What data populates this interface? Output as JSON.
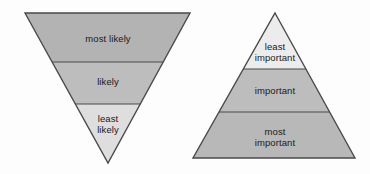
{
  "canvas": {
    "width": 370,
    "height": 174,
    "background": "#fdfdfd"
  },
  "colors": {
    "band_dark": "#b3b3b3",
    "band_mid": "#bdbdbd",
    "band_light": "#dedede",
    "band_lightest": "#ececec",
    "outline": "#4a4a4a",
    "divider": "#4a4a4a",
    "text": "#1a1a1a"
  },
  "diagrams": [
    {
      "id": "likelihood-triangle",
      "name": "inverted-triangle-likelihood",
      "orientation": "inverted",
      "geometry": {
        "top_left_x": 25,
        "top_right_x": 190,
        "top_y": 13,
        "apex_x": 108,
        "apex_y": 163,
        "divider_y": [
          62,
          104
        ]
      },
      "bands": [
        {
          "name": "band-most-likely",
          "label": "most likely",
          "fill": "#b3b3b3",
          "label_x": 108,
          "label_y": 33,
          "lines": 1
        },
        {
          "name": "band-likely",
          "label": "likely",
          "fill": "#bdbdbd",
          "label_x": 108,
          "label_y": 76,
          "lines": 1
        },
        {
          "name": "band-least-likely",
          "label": "least\nlikely",
          "fill": "#dedede",
          "label_x": 108,
          "label_y": 113,
          "lines": 2
        }
      ]
    },
    {
      "id": "importance-pyramid",
      "name": "pyramid-importance",
      "orientation": "upright",
      "geometry": {
        "apex_x": 275,
        "apex_y": 13,
        "base_left_x": 193,
        "base_right_x": 355,
        "base_y": 158,
        "divider_y": [
          69,
          112
        ]
      },
      "bands": [
        {
          "name": "band-least-important",
          "label": "least\nimportant",
          "fill": "#ececec",
          "label_x": 275,
          "label_y": 41,
          "lines": 2
        },
        {
          "name": "band-important",
          "label": "important",
          "fill": "#bdbdbd",
          "label_x": 275,
          "label_y": 85,
          "lines": 1
        },
        {
          "name": "band-most-important",
          "label": "most\nimportant",
          "fill": "#b8b8b8",
          "label_x": 275,
          "label_y": 126,
          "lines": 2
        }
      ]
    }
  ]
}
